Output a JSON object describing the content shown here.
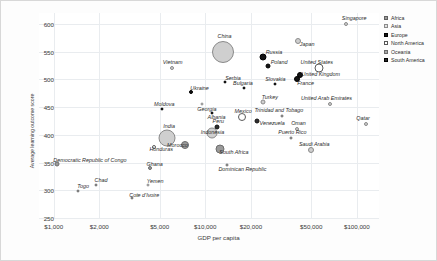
{
  "chart_data": {
    "type": "scatter",
    "title": "",
    "xlabel": "GDP per capita",
    "ylabel": "Average learning outcome score",
    "xscale": "log",
    "xlim": [
      800,
      140000
    ],
    "ylim": [
      250,
      620
    ],
    "xticks": [
      "$1,000",
      "$2,000",
      "$5,000",
      "$10,000",
      "$20,000",
      "$50,000",
      "$100,000"
    ],
    "xtick_values": [
      1000,
      2000,
      5000,
      10000,
      20000,
      50000,
      100000
    ],
    "yticks": [
      "250",
      "300",
      "350",
      "400",
      "450",
      "500",
      "550",
      "600"
    ],
    "ytick_values": [
      250,
      300,
      350,
      400,
      450,
      500,
      550,
      600
    ],
    "grid": true,
    "legend_position": "right",
    "legend": [
      {
        "label": "Africa",
        "marker": "africa"
      },
      {
        "label": "Asia",
        "marker": "asia"
      },
      {
        "label": "Europe",
        "marker": "europe"
      },
      {
        "label": "North America",
        "marker": "northamerica"
      },
      {
        "label": "Oceania",
        "marker": "oceania"
      },
      {
        "label": "South America",
        "marker": "southamerica"
      }
    ],
    "points": [
      {
        "name": "Singapore",
        "gdp": 85000,
        "score": 600,
        "continent": "asia",
        "size": 4,
        "lx": 8,
        "ly": -6
      },
      {
        "name": "Japan",
        "gdp": 41000,
        "score": 570,
        "continent": "asia",
        "size": 6,
        "lx": 9,
        "ly": 3
      },
      {
        "name": "China",
        "gdp": 13000,
        "score": 550,
        "continent": "asia",
        "size": 22,
        "lx": 2,
        "ly": -16
      },
      {
        "name": "Russia",
        "gdp": 24000,
        "score": 540,
        "continent": "europe",
        "size": 7,
        "lx": 11,
        "ly": -5
      },
      {
        "name": "Poland",
        "gdp": 26000,
        "score": 525,
        "continent": "europe",
        "size": 5,
        "lx": 11,
        "ly": -4
      },
      {
        "name": "United States",
        "gdp": 56000,
        "score": 520,
        "continent": "northamerica",
        "size": 9,
        "lx": -2,
        "ly": -6
      },
      {
        "name": "United Kingdom",
        "gdp": 42000,
        "score": 508,
        "continent": "europe",
        "size": 6,
        "lx": 21,
        "ly": -1
      },
      {
        "name": "Vietnam",
        "gdp": 6000,
        "score": 520,
        "continent": "asia",
        "size": 4,
        "lx": 1,
        "ly": -6
      },
      {
        "name": "France",
        "gdp": 40000,
        "score": 500,
        "continent": "europe",
        "size": 6,
        "lx": 9,
        "ly": 4
      },
      {
        "name": "Serbia",
        "gdp": 13500,
        "score": 495,
        "continent": "europe",
        "size": 3,
        "lx": 8,
        "ly": -4
      },
      {
        "name": "Slovakia",
        "gdp": 29000,
        "score": 492,
        "continent": "europe",
        "size": 3,
        "lx": 0,
        "ly": -5
      },
      {
        "name": "Bulgaria",
        "gdp": 18000,
        "score": 485,
        "continent": "europe",
        "size": 3,
        "lx": -1,
        "ly": -5
      },
      {
        "name": "Ukraine",
        "gdp": 8000,
        "score": 478,
        "continent": "europe",
        "size": 4,
        "lx": 9,
        "ly": -4
      },
      {
        "name": "Turkey",
        "gdp": 24000,
        "score": 460,
        "continent": "asia",
        "size": 5,
        "lx": 7,
        "ly": -5
      },
      {
        "name": "Georgia",
        "gdp": 9500,
        "score": 455,
        "continent": "asia",
        "size": 3,
        "lx": 5,
        "ly": 5
      },
      {
        "name": "Moldova",
        "gdp": 5200,
        "score": 447,
        "continent": "europe",
        "size": 3,
        "lx": 2,
        "ly": -5
      },
      {
        "name": "United Arab Emirates",
        "gdp": 67000,
        "score": 455,
        "continent": "asia",
        "size": 4,
        "lx": -4,
        "ly": -6
      },
      {
        "name": "Albania",
        "gdp": 11000,
        "score": 440,
        "continent": "europe",
        "size": 3,
        "lx": 5,
        "ly": 4
      },
      {
        "name": "Mexico",
        "gdp": 17500,
        "score": 432,
        "continent": "northamerica",
        "size": 8,
        "lx": 1,
        "ly": -6
      },
      {
        "name": "Venezuela",
        "gdp": 22000,
        "score": 425,
        "continent": "southamerica",
        "size": 5,
        "lx": 15,
        "ly": 2
      },
      {
        "name": "Trinidad and Tobago",
        "gdp": 32000,
        "score": 435,
        "continent": "northamerica",
        "size": 3,
        "lx": -3,
        "ly": -6
      },
      {
        "name": "Qatar",
        "gdp": 115000,
        "score": 420,
        "continent": "asia",
        "size": 4,
        "lx": -3,
        "ly": -6
      },
      {
        "name": "Peru",
        "gdp": 12000,
        "score": 415,
        "continent": "southamerica",
        "size": 5,
        "lx": 1,
        "ly": -6
      },
      {
        "name": "Oman",
        "gdp": 40000,
        "score": 410,
        "continent": "asia",
        "size": 4,
        "lx": 2,
        "ly": -6
      },
      {
        "name": "Indonesia",
        "gdp": 11000,
        "score": 403,
        "continent": "asia",
        "size": 11,
        "lx": 1,
        "ly": -1
      },
      {
        "name": "Puerto Rico",
        "gdp": 37000,
        "score": 395,
        "continent": "northamerica",
        "size": 3,
        "lx": 1,
        "ly": -6
      },
      {
        "name": "India",
        "gdp": 5600,
        "score": 395,
        "continent": "asia",
        "size": 17,
        "lx": 2,
        "ly": -12
      },
      {
        "name": "Morocco",
        "gdp": 7400,
        "score": 382,
        "continent": "africa",
        "size": 8,
        "lx": -8,
        "ly": 0
      },
      {
        "name": "South Africa",
        "gdp": 12500,
        "score": 375,
        "continent": "africa",
        "size": 9,
        "lx": 14,
        "ly": 3
      },
      {
        "name": "Honduras",
        "gdp": 4600,
        "score": 378,
        "continent": "northamerica",
        "size": 4,
        "lx": 7,
        "ly": 2
      },
      {
        "name": "Saudi Arabia",
        "gdp": 50000,
        "score": 372,
        "continent": "asia",
        "size": 6,
        "lx": 3,
        "ly": -6
      },
      {
        "name": "Dominican Republic",
        "gdp": 14000,
        "score": 345,
        "continent": "northamerica",
        "size": 3,
        "lx": 15,
        "ly": 4
      },
      {
        "name": "Ghana",
        "gdp": 4300,
        "score": 340,
        "continent": "africa",
        "size": 4,
        "lx": 5,
        "ly": -4
      },
      {
        "name": "Democratic Republic of Congo",
        "gdp": 1050,
        "score": 348,
        "continent": "africa",
        "size": 5,
        "lx": 33,
        "ly": -4
      },
      {
        "name": "Chad",
        "gdp": 1900,
        "score": 310,
        "continent": "africa",
        "size": 3,
        "lx": 5,
        "ly": -5
      },
      {
        "name": "Yemen",
        "gdp": 4200,
        "score": 310,
        "continent": "asia",
        "size": 3,
        "lx": 7,
        "ly": -4
      },
      {
        "name": "Togo",
        "gdp": 1450,
        "score": 298,
        "continent": "africa",
        "size": 3,
        "lx": 5,
        "ly": -5
      },
      {
        "name": "Cote d'Ivoire",
        "gdp": 3300,
        "score": 287,
        "continent": "africa",
        "size": 3,
        "lx": 12,
        "ly": -3
      }
    ]
  }
}
